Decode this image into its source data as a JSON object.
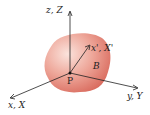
{
  "diagram": {
    "body_color": "#e07a6a",
    "body_highlight": "#f6c8bd",
    "axis_color": "#222222",
    "labels": {
      "z_axis": "z, Z",
      "x_prime_axis": "x', X'",
      "y_axis": "y, Y",
      "x_axis": "x, X",
      "origin": "P",
      "body": "B"
    }
  }
}
